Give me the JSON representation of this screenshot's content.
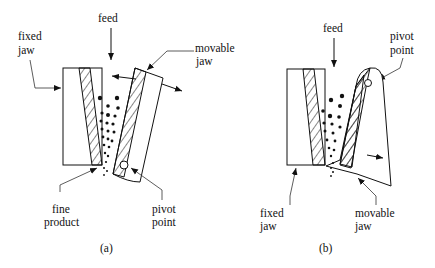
{
  "diagram": {
    "colors": {
      "line": "#111111",
      "background": "#ffffff"
    },
    "panels": [
      {
        "id": "a",
        "caption": "(a)",
        "labels": {
          "feed": "feed",
          "fixed_jaw_line1": "fixed",
          "fixed_jaw_line2": "jaw",
          "movable_jaw_line1": "movable",
          "movable_jaw_line2": "jaw",
          "fine_product_line1": "fine",
          "fine_product_line2": "product",
          "pivot_point_line1": "pivot",
          "pivot_point_line2": "point"
        }
      },
      {
        "id": "b",
        "caption": "(b)",
        "labels": {
          "feed": "feed",
          "pivot_point_line1": "pivot",
          "pivot_point_line2": "point",
          "fixed_jaw_line1": "fixed",
          "fixed_jaw_line2": "jaw",
          "movable_jaw_line1": "movable",
          "movable_jaw_line2": "jaw"
        }
      }
    ]
  }
}
